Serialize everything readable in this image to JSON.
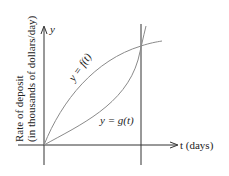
{
  "diagram": {
    "y_axis_label": "y",
    "x_axis_label": "t (days)",
    "ylabel_line1": "Rate of deposit",
    "ylabel_line2": "(in thousands of dollars/day)",
    "curve_f_label": "y = f(t)",
    "curve_g_label": "y = g(t)",
    "colors": {
      "axes": "#333333",
      "curves": "#8a8a8a",
      "text": "#222222"
    }
  }
}
